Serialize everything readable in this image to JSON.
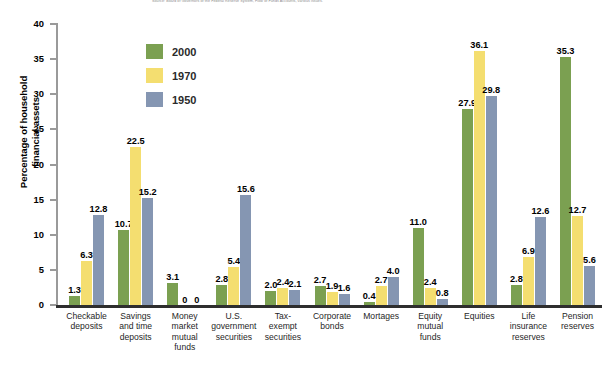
{
  "source_note": "Source: Board of Governors of the Federal Reserve System, Flow of Funds Accounts, various issues.",
  "axis": {
    "ylabel_line1": "Percentage of household",
    "ylabel_line2": "financial assets",
    "yticks": [
      "40",
      "35",
      "30",
      "25",
      "20",
      "15",
      "10",
      "5",
      "0"
    ]
  },
  "legend": {
    "items": [
      {
        "label": "2000",
        "color": "#7ba051"
      },
      {
        "label": "1970",
        "color": "#f4de70"
      },
      {
        "label": "1950",
        "color": "#8596b2"
      }
    ]
  },
  "chart_data": {
    "type": "bar",
    "title": "",
    "xlabel": "",
    "ylabel": "Percentage of household financial assets",
    "ylim": [
      0,
      40
    ],
    "ytick_step": 5,
    "grid": false,
    "legend_position": "upper-left-inside",
    "categories": [
      "Checkable deposits",
      "Savings and time deposits",
      "Money market mutual funds",
      "U.S. government securities",
      "Tax-exempt securities",
      "Corporate bonds",
      "Mortages",
      "Equity mutual funds",
      "Equities",
      "Life insurance reserves",
      "Pension reserves"
    ],
    "category_lines": [
      [
        "Checkable",
        "deposits"
      ],
      [
        "Savings",
        "and time",
        "deposits"
      ],
      [
        "Money",
        "market",
        "mutual",
        "funds"
      ],
      [
        "U.S.",
        "government",
        "securities"
      ],
      [
        "Tax-",
        "exempt",
        "securities"
      ],
      [
        "Corporate",
        "bonds"
      ],
      [
        "Mortages"
      ],
      [
        "Equity",
        "mutual",
        "funds"
      ],
      [
        "Equities"
      ],
      [
        "Life",
        "insurance",
        "reserves"
      ],
      [
        "Pension",
        "reserves"
      ]
    ],
    "series": [
      {
        "name": "2000",
        "color": "#7ba051",
        "values": [
          1.3,
          10.7,
          3.1,
          2.8,
          2.0,
          2.7,
          0.4,
          11.0,
          27.9,
          2.8,
          35.3
        ],
        "labels": [
          "1.3",
          "10.7",
          "3.1",
          "2.8",
          "2.0",
          "2.7",
          "0.4",
          "11.0",
          "27.9",
          "2.8",
          "35.3"
        ]
      },
      {
        "name": "1970",
        "color": "#f4de70",
        "values": [
          6.3,
          22.5,
          0,
          5.4,
          2.4,
          1.9,
          2.7,
          2.4,
          36.1,
          6.9,
          12.7
        ],
        "labels": [
          "6.3",
          "22.5",
          "0",
          "5.4",
          "2.4",
          "1.9",
          "2.7",
          "2.4",
          "36.1",
          "6.9",
          "12.7"
        ]
      },
      {
        "name": "1950",
        "color": "#8596b2",
        "values": [
          12.8,
          15.2,
          0,
          15.6,
          2.1,
          1.6,
          4.0,
          0.8,
          29.8,
          12.6,
          5.6
        ],
        "labels": [
          "12.8",
          "15.2",
          "0",
          "15.6",
          "2.1",
          "1.6",
          "4.0",
          "0.8",
          "29.8",
          "12.6",
          "5.6"
        ]
      }
    ]
  }
}
